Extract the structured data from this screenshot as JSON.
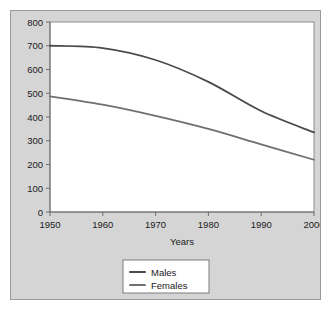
{
  "chart_data": {
    "type": "line",
    "title": "",
    "xlabel": "Years",
    "ylabel": "",
    "x": [
      1950,
      1960,
      1970,
      1980,
      1990,
      2000
    ],
    "xtick_labels": [
      "1950",
      "1960",
      "1970",
      "1980",
      "1990",
      "2000"
    ],
    "ytick_labels": [
      "0",
      "100",
      "200",
      "300",
      "400",
      "500",
      "600",
      "700",
      "800"
    ],
    "ytick_values": [
      0,
      100,
      200,
      300,
      400,
      500,
      600,
      700,
      800
    ],
    "xlim": [
      1950,
      2000
    ],
    "ylim": [
      0,
      800
    ],
    "grid": false,
    "legend_position": "below-center",
    "series": [
      {
        "name": "Males",
        "color": "#4a4a4a",
        "values": [
          700,
          690,
          640,
          548,
          425,
          335
        ]
      },
      {
        "name": "Females",
        "color": "#6f6f6f",
        "values": [
          487,
          452,
          405,
          350,
          285,
          220
        ]
      }
    ]
  },
  "figure": {
    "background_color": "#d5d5d5",
    "plot_background_color": "#ffffff",
    "border_color": "#9a9a9a"
  },
  "legend": {
    "entries": [
      {
        "label": "Males",
        "swatch": "legend-line-swatch"
      },
      {
        "label": "Females",
        "swatch": "legend-line-swatch"
      }
    ]
  }
}
